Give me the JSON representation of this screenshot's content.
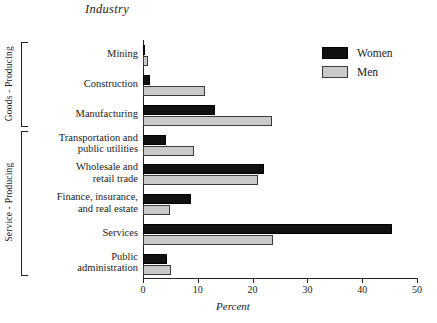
{
  "chart_data": {
    "type": "bar",
    "orientation": "horizontal",
    "title": "Industry",
    "xlabel": "Percent",
    "ylabel": "",
    "xlim": [
      0,
      50
    ],
    "xticks": [
      0,
      10,
      20,
      30,
      40,
      50
    ],
    "xtick_labels": [
      "0",
      "10",
      "20",
      "30",
      "40",
      "50"
    ],
    "grid": false,
    "legend_position": "top-right",
    "categories": [
      "Mining",
      "Construction",
      "Manufacturing",
      "Transportation and public utilities",
      "Wholesale and retail trade",
      "Finance, insurance, and real estate",
      "Services",
      "Public administration"
    ],
    "category_lines": [
      [
        "Mining"
      ],
      [
        "Construction"
      ],
      [
        "Manufacturing"
      ],
      [
        "Transportation and",
        "public utilities"
      ],
      [
        "Wholesale and",
        "retail trade"
      ],
      [
        "Finance, insurance,",
        "and real estate"
      ],
      [
        "Services"
      ],
      [
        "Public",
        "administration"
      ]
    ],
    "series": [
      {
        "name": "Women",
        "color": "#111111",
        "values": [
          0.4,
          1.2,
          13.1,
          4.2,
          22.1,
          8.8,
          45.4,
          4.4
        ]
      },
      {
        "name": "Men",
        "color": "#c9c9c9",
        "values": [
          0.9,
          11.3,
          23.5,
          9.3,
          21.0,
          5.0,
          23.7,
          5.1
        ]
      }
    ],
    "groups": [
      {
        "label": "Goods - Producing",
        "categories": [
          "Mining",
          "Construction",
          "Manufacturing"
        ]
      },
      {
        "label": "Service - Producing",
        "categories": [
          "Transportation and public utilities",
          "Wholesale and retail trade",
          "Finance, insurance, and real estate",
          "Services",
          "Public administration"
        ]
      }
    ]
  },
  "legend": {
    "items": [
      {
        "label": "Women",
        "swatch": "black-square-swatch"
      },
      {
        "label": "Men",
        "swatch": "gray-square-swatch"
      }
    ]
  }
}
